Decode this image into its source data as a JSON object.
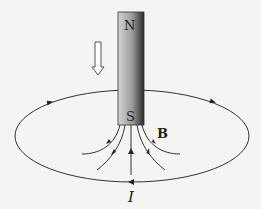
{
  "figure": {
    "magnet": {
      "north_label": "N",
      "south_label": "S",
      "motion": "down"
    },
    "field_label": "B",
    "current_label": "I",
    "colors": {
      "background": "#f4f4f2",
      "line": "#333333",
      "magnet_light": "#d8d8d8",
      "magnet_dark": "#2a2a2a"
    }
  }
}
